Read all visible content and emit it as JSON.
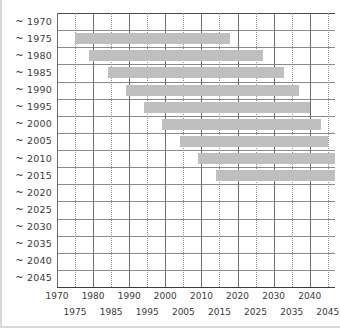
{
  "chart_data": {
    "type": "bar",
    "orientation": "horizontal",
    "subtype": "gantt-range",
    "title": "",
    "subtitle": "",
    "xlabel": "",
    "ylabel": "",
    "xlim": [
      1970,
      2047
    ],
    "grid": true,
    "legend": false,
    "legend_position": "none",
    "bar_color": "#bfbfbf",
    "grid_color_major": "#6b6b6b",
    "grid_color_minor": "#8f8f8f",
    "axis_color": "#3d3d3d",
    "categories": [
      "~ 1970",
      "~ 1975",
      "~ 1980",
      "~ 1985",
      "~ 1990",
      "~ 1995",
      "~ 2000",
      "~ 2005",
      "~ 2010",
      "~ 2015",
      "~ 2020",
      "~ 2025",
      "~ 2030",
      "~ 2035",
      "~ 2040",
      "~ 2045"
    ],
    "x_major_ticks": [
      1970,
      1980,
      1990,
      2000,
      2010,
      2020,
      2030,
      2040
    ],
    "x_minor_ticks": [
      1975,
      1985,
      1995,
      2005,
      2015,
      2025,
      2035,
      2045
    ],
    "x_tick_labels_row1": [
      "1970",
      "1980",
      "1990",
      "2000",
      "2010",
      "2020",
      "2030",
      "2040"
    ],
    "x_tick_labels_row2": [
      "1975",
      "1985",
      "1995",
      "2005",
      "2015",
      "2025",
      "2035",
      "2045"
    ],
    "bars": [
      {
        "category": "~ 1970",
        "start": null,
        "end": null
      },
      {
        "category": "~ 1975",
        "start": 1975,
        "end": 2018
      },
      {
        "category": "~ 1980",
        "start": 1979,
        "end": 2027
      },
      {
        "category": "~ 1985",
        "start": 1984,
        "end": 2033
      },
      {
        "category": "~ 1990",
        "start": 1989,
        "end": 2037
      },
      {
        "category": "~ 1995",
        "start": 1994,
        "end": 2040
      },
      {
        "category": "~ 2000",
        "start": 1999,
        "end": 2043
      },
      {
        "category": "~ 2005",
        "start": 2004,
        "end": 2045
      },
      {
        "category": "~ 2010",
        "start": 2009,
        "end": 2047
      },
      {
        "category": "~ 2015",
        "start": 2014,
        "end": 2047
      },
      {
        "category": "~ 2020",
        "start": null,
        "end": null
      },
      {
        "category": "~ 2025",
        "start": null,
        "end": null
      },
      {
        "category": "~ 2030",
        "start": null,
        "end": null
      },
      {
        "category": "~ 2035",
        "start": null,
        "end": null
      },
      {
        "category": "~ 2040",
        "start": null,
        "end": null
      },
      {
        "category": "~ 2045",
        "start": null,
        "end": null
      }
    ]
  }
}
